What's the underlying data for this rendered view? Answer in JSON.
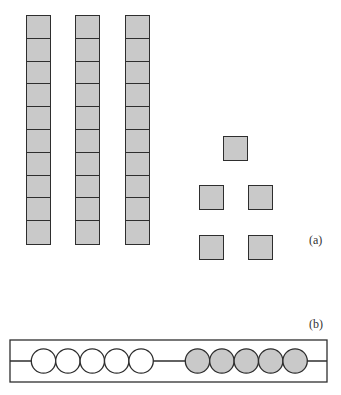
{
  "figure": {
    "part_a": {
      "label": "(a)",
      "description": "Base-ten blocks: three tens rods and five unit cubes",
      "rods": {
        "count": 3,
        "units_per_rod": 10,
        "x": [
          26,
          75,
          125
        ],
        "top": 15
      },
      "units": [
        {
          "x": 223,
          "y": 136
        },
        {
          "x": 199,
          "y": 185
        },
        {
          "x": 248,
          "y": 185
        },
        {
          "x": 199,
          "y": 235
        },
        {
          "x": 248,
          "y": 235
        }
      ],
      "colors": {
        "fill": "#c9c9c9",
        "stroke": "#2e2e2e"
      }
    },
    "part_b": {
      "label": "(b)",
      "description": "Abacus wire with five white beads and five shaded beads",
      "white_beads": 5,
      "shaded_beads": 5,
      "colors": {
        "white": "#ffffff",
        "shaded": "#c9c9c9",
        "stroke": "#2e2e2e"
      }
    }
  }
}
